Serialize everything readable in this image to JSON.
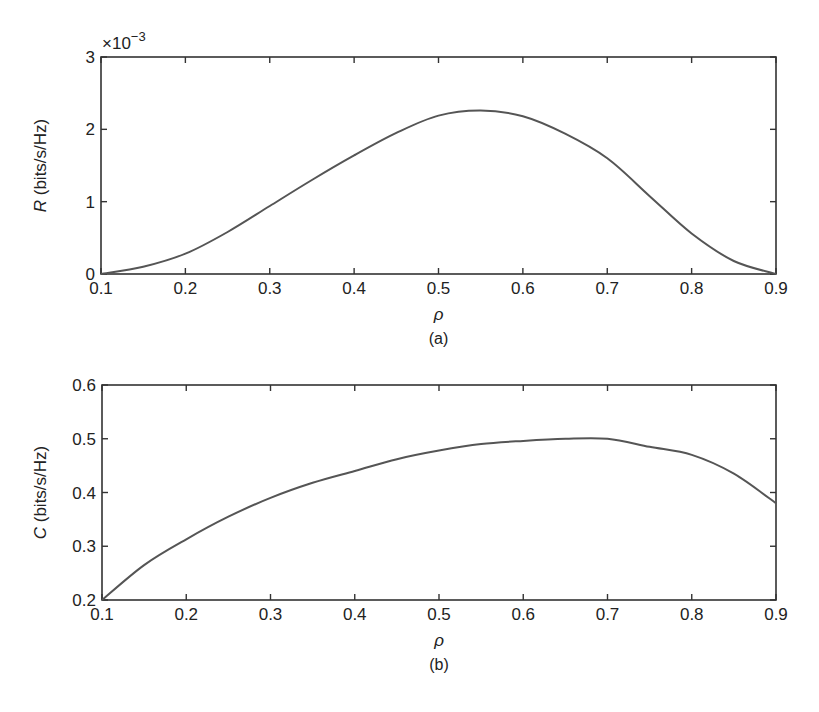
{
  "chart_data": [
    {
      "type": "line",
      "panel_label": "(a)",
      "title": "",
      "xlabel": "ρ",
      "ylabel_symbol": "R",
      "ylabel_unit": " (bits/s/Hz)",
      "y_multiplier": "×10",
      "y_multiplier_exp": "−3",
      "xlim": [
        0.1,
        0.9
      ],
      "ylim": [
        0,
        3
      ],
      "x_ticks": [
        "0.1",
        "0.2",
        "0.3",
        "0.4",
        "0.5",
        "0.6",
        "0.7",
        "0.8",
        "0.9"
      ],
      "y_ticks": [
        "0",
        "1",
        "2",
        "3"
      ],
      "grid": false,
      "series": [
        {
          "name": "R",
          "x": [
            0.1,
            0.15,
            0.2,
            0.25,
            0.3,
            0.35,
            0.4,
            0.45,
            0.5,
            0.55,
            0.6,
            0.65,
            0.7,
            0.75,
            0.8,
            0.85,
            0.9
          ],
          "values": [
            0.0,
            0.1,
            0.28,
            0.58,
            0.94,
            1.3,
            1.64,
            1.95,
            2.19,
            2.26,
            2.18,
            1.94,
            1.6,
            1.08,
            0.56,
            0.18,
            0.0
          ]
        }
      ]
    },
    {
      "type": "line",
      "panel_label": "(b)",
      "title": "",
      "xlabel": "ρ",
      "ylabel_symbol": "C",
      "ylabel_unit": " (bits/s/Hz)",
      "xlim": [
        0.1,
        0.9
      ],
      "ylim": [
        0.2,
        0.6
      ],
      "x_ticks": [
        "0.1",
        "0.2",
        "0.3",
        "0.4",
        "0.5",
        "0.6",
        "0.7",
        "0.8",
        "0.9"
      ],
      "y_ticks": [
        "0.2",
        "0.3",
        "0.4",
        "0.5",
        "0.6"
      ],
      "grid": false,
      "series": [
        {
          "name": "C",
          "x": [
            0.1,
            0.15,
            0.2,
            0.25,
            0.3,
            0.35,
            0.4,
            0.45,
            0.5,
            0.55,
            0.6,
            0.65,
            0.7,
            0.75,
            0.8,
            0.85,
            0.9
          ],
          "values": [
            0.2,
            0.265,
            0.313,
            0.355,
            0.39,
            0.418,
            0.44,
            0.462,
            0.478,
            0.49,
            0.496,
            0.5,
            0.5,
            0.485,
            0.47,
            0.435,
            0.38
          ]
        }
      ]
    }
  ]
}
